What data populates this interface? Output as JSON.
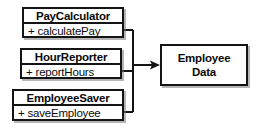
{
  "diagram": {
    "type": "uml-class-diagram",
    "background_color": "#ffffff",
    "line_color": "#141414",
    "text_color": "#0a0a0a",
    "classes": [
      {
        "id": "paycalculator",
        "name": "PayCalculator",
        "methods": [
          {
            "visibility": "+",
            "label": "+ calculatePay",
            "name": "calculatePay"
          }
        ]
      },
      {
        "id": "hourreporter",
        "name": "HourReporter",
        "methods": [
          {
            "visibility": "+",
            "label": "+ reportHours",
            "name": "reportHours"
          }
        ]
      },
      {
        "id": "employeesaver",
        "name": "EmployeeSaver",
        "methods": [
          {
            "visibility": "+",
            "label": "+ saveEmployee",
            "name": "saveEmployee"
          }
        ]
      }
    ],
    "entity": {
      "id": "employee-data",
      "line1": "Employee",
      "line2": "Data"
    },
    "connector": {
      "style": "solid",
      "arrowhead": "open-arrow",
      "direction": "classes-to-entity",
      "icon": "arrow-right-icon"
    }
  }
}
